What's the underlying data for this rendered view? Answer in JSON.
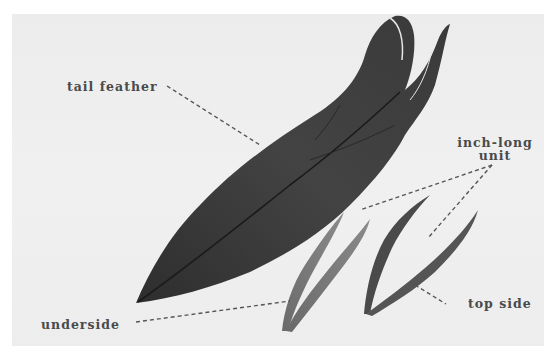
{
  "image": {
    "subject": "feather anatomy illustration",
    "colors": {
      "background": "#eeeeee",
      "feather": "#3c3c3c",
      "label_text": "#4a4a4a",
      "leader_line": "#555555"
    }
  },
  "labels": {
    "tail_feather": "tail feather",
    "inch_long_unit_line1": "inch-long",
    "inch_long_unit_line2": "unit",
    "underside": "underside",
    "top_side": "top side"
  }
}
